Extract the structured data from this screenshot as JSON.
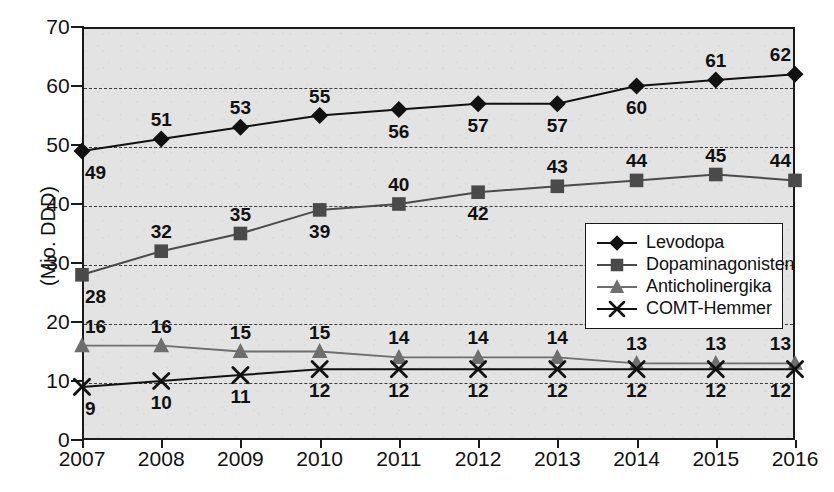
{
  "chart_data": {
    "type": "line",
    "title": "",
    "xlabel": "",
    "ylabel": "(Mio. DDD)",
    "categories": [
      "2007",
      "2008",
      "2009",
      "2010",
      "2011",
      "2012",
      "2013",
      "2014",
      "2015",
      "2016"
    ],
    "ylim": [
      0,
      70
    ],
    "ytick_labels": [
      "0",
      "10",
      "20",
      "30",
      "40",
      "50",
      "60",
      "70"
    ],
    "grid": "horizontal-dashed",
    "legend_position": "inside-right-middle",
    "series": [
      {
        "name": "Levodopa",
        "marker": "diamond",
        "color": "#111111",
        "values": [
          49,
          51,
          53,
          55,
          56,
          57,
          57,
          60,
          61,
          62
        ],
        "labels": [
          "49",
          "51",
          "53",
          "55",
          "56",
          "57",
          "57",
          "60",
          "61",
          "62"
        ],
        "label_positions": [
          "below",
          "above",
          "above",
          "above",
          "below",
          "below",
          "below",
          "below",
          "above",
          "above"
        ]
      },
      {
        "name": "Dopaminagonisten",
        "marker": "square",
        "color": "#4a4a4a",
        "values": [
          28,
          32,
          35,
          39,
          40,
          42,
          43,
          44,
          45,
          44
        ],
        "labels": [
          "28",
          "32",
          "35",
          "39",
          "40",
          "42",
          "43",
          "44",
          "45",
          "44"
        ],
        "label_positions": [
          "below",
          "above",
          "above",
          "below",
          "above",
          "below",
          "above",
          "above",
          "above",
          "above"
        ]
      },
      {
        "name": "Anticholinergika",
        "marker": "triangle",
        "color": "#6e6e6e",
        "values": [
          16,
          16,
          15,
          15,
          14,
          14,
          14,
          13,
          13,
          13
        ],
        "labels": [
          "16",
          "16",
          "15",
          "15",
          "14",
          "14",
          "14",
          "13",
          "13",
          "13"
        ],
        "label_positions": [
          "above",
          "above",
          "above",
          "above",
          "above",
          "above",
          "above",
          "above",
          "above",
          "above"
        ]
      },
      {
        "name": "COMT-Hemmer",
        "marker": "cross",
        "color": "#111111",
        "values": [
          9,
          10,
          11,
          12,
          12,
          12,
          12,
          12,
          12,
          12
        ],
        "labels": [
          "9",
          "10",
          "11",
          "12",
          "12",
          "12",
          "12",
          "12",
          "12",
          "12"
        ],
        "label_positions": [
          "below",
          "below",
          "below",
          "below",
          "below",
          "below",
          "below",
          "below",
          "below",
          "below"
        ]
      }
    ]
  },
  "legend": {
    "items": [
      {
        "label": "Levodopa",
        "marker": "diamond",
        "color": "#111111"
      },
      {
        "label": "Dopaminagonisten",
        "marker": "square",
        "color": "#4a4a4a"
      },
      {
        "label": "Anticholinergika",
        "marker": "triangle",
        "color": "#6e6e6e"
      },
      {
        "label": "COMT-Hemmer",
        "marker": "cross",
        "color": "#111111"
      }
    ]
  },
  "colors": {
    "plot_background": "#e3e3e3",
    "axis": "#1a1a1a",
    "gridline": "#3a3a3a",
    "page_background": "#ffffff"
  }
}
